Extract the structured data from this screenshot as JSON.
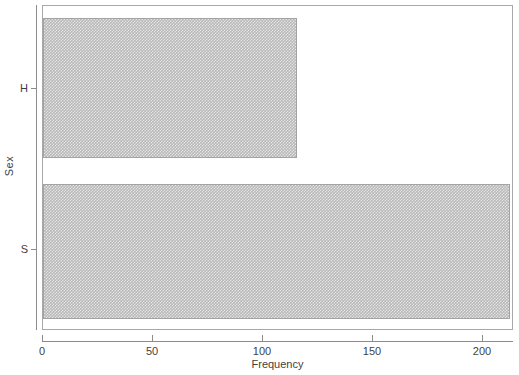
{
  "chart_data": {
    "type": "bar",
    "orientation": "horizontal",
    "title": "",
    "xlabel": "Frequency",
    "ylabel": "Sex",
    "categories": [
      "H",
      "S"
    ],
    "values": [
      116,
      213
    ],
    "series": [
      {
        "name": "Frequency",
        "values": [
          116,
          213
        ]
      }
    ],
    "xlim": [
      0,
      214
    ],
    "ylim": [
      0,
      2
    ],
    "xticks": [
      0,
      50,
      100,
      150,
      200
    ],
    "xticklabels": [
      "0",
      "50",
      "100",
      "150",
      "200"
    ],
    "yticklabels": [
      "H",
      "S"
    ],
    "grid": false,
    "legend": null,
    "bar_fill_color": "#b9b9b9",
    "bar_edge_color": "#a3a3a3",
    "axis_color": "#8c8c8c",
    "background_color": "#ffffff"
  },
  "axes": {
    "x": {
      "label": "Frequency",
      "ticks": [
        {
          "value": 0,
          "label": "0"
        },
        {
          "value": 50,
          "label": "50"
        },
        {
          "value": 100,
          "label": "100"
        },
        {
          "value": 150,
          "label": "150"
        },
        {
          "value": 200,
          "label": "200"
        }
      ]
    },
    "y": {
      "label": "Sex",
      "ticks": [
        {
          "value": "H",
          "label": "H"
        },
        {
          "value": "S",
          "label": "S"
        }
      ]
    }
  },
  "bars": [
    {
      "category": "H",
      "value": 116
    },
    {
      "category": "S",
      "value": 213
    }
  ]
}
